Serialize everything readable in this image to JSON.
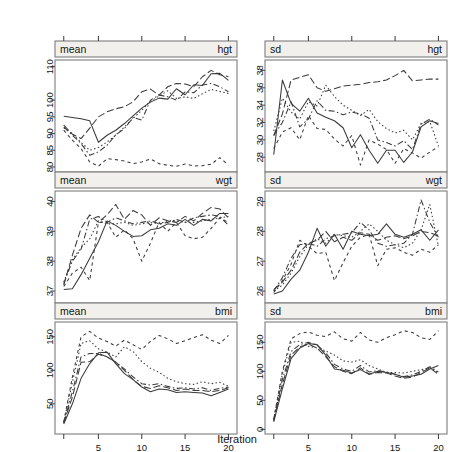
{
  "figure": {
    "xlabel": "Iteration",
    "x_ticks": [
      5,
      10,
      15,
      20
    ],
    "xlim": [
      1,
      20
    ],
    "n_chains": 5,
    "line_styles": [
      "solid",
      "dashed",
      "dotted",
      "dashdot",
      "longdash"
    ],
    "line_color": "#3a3a3a"
  },
  "panels": [
    {
      "id": "mean-hgt",
      "row": 0,
      "col": 0,
      "strip_left": "mean",
      "strip_right": "hgt",
      "y_ticks": [
        80,
        85,
        90,
        95,
        100,
        110
      ],
      "ylim": [
        78.5,
        112
      ]
    },
    {
      "id": "sd-hgt",
      "row": 0,
      "col": 1,
      "strip_left": "sd",
      "strip_right": "hgt",
      "y_ticks": [
        28,
        30,
        32,
        34,
        36,
        38
      ],
      "ylim": [
        26.3,
        39.2
      ]
    },
    {
      "id": "mean-wgt",
      "row": 1,
      "col": 0,
      "strip_left": "mean",
      "strip_right": "wgt",
      "y_ticks": [
        37,
        38,
        39,
        40
      ],
      "ylim": [
        36.6,
        40.35
      ]
    },
    {
      "id": "sd-wgt",
      "row": 1,
      "col": 1,
      "strip_left": "sd",
      "strip_right": "wgt",
      "y_ticks": [
        26,
        27,
        28,
        29
      ],
      "ylim": [
        25.6,
        29.35
      ]
    },
    {
      "id": "mean-bmi",
      "row": 2,
      "col": 0,
      "strip_left": "mean",
      "strip_right": "bmi",
      "y_ticks": [
        50,
        100,
        150
      ],
      "ylim": [
        5,
        172
      ]
    },
    {
      "id": "sd-bmi",
      "row": 2,
      "col": 1,
      "strip_left": "sd",
      "strip_right": "bmi",
      "y_ticks": [
        0,
        50,
        100,
        150
      ],
      "ylim": [
        -8,
        185
      ]
    }
  ],
  "chart_data": {
    "type": "line",
    "title": "",
    "xlabel": "Iteration",
    "ylabel": "",
    "x": [
      1,
      2,
      3,
      4,
      5,
      6,
      7,
      8,
      9,
      10,
      11,
      12,
      13,
      14,
      15,
      16,
      17,
      18,
      19,
      20
    ],
    "panels": [
      {
        "panel": "mean-hgt",
        "ylim": [
          78.5,
          112
        ],
        "yticks": [
          80,
          85,
          90,
          95,
          100,
          110
        ],
        "series": [
          {
            "name": "chain1",
            "style": "solid",
            "values": [
              95.2,
              94.8,
              94.4,
              93.8,
              87.4,
              89.5,
              91.0,
              93.0,
              95.3,
              97.6,
              99.4,
              100.6,
              100.3,
              103.4,
              101.6,
              104.6,
              104.4,
              107.9,
              108.0,
              105.9
            ]
          },
          {
            "name": "chain2",
            "style": "dashed",
            "values": [
              92.5,
              89.8,
              88.5,
              91.6,
              95.0,
              96.5,
              97.4,
              98.0,
              99.5,
              102.5,
              103.3,
              101.5,
              104.0,
              105.0,
              104.8,
              104.0,
              107.0,
              108.9,
              107.6,
              107.0
            ]
          },
          {
            "name": "chain3",
            "style": "dotted",
            "values": [
              91.7,
              90.0,
              87.3,
              85.0,
              85.8,
              87.5,
              89.5,
              92.0,
              94.5,
              97.0,
              99.7,
              101.2,
              102.8,
              100.5,
              101.0,
              100.5,
              101.9,
              103.2,
              102.6,
              102.0
            ]
          },
          {
            "name": "chain4",
            "style": "dashdot",
            "values": [
              92.0,
              89.5,
              87.0,
              83.5,
              84.5,
              86.5,
              89.6,
              91.5,
              94.8,
              94.0,
              100.0,
              101.5,
              101.0,
              100.0,
              102.5,
              102.2,
              104.5,
              105.0,
              104.0,
              102.5
            ]
          },
          {
            "name": "chain5",
            "style": "longdash",
            "values": [
              91.0,
              88.0,
              85.5,
              81.5,
              80.2,
              82.5,
              82.2,
              81.8,
              81.0,
              81.5,
              82.4,
              81.0,
              80.5,
              80.2,
              80.9,
              80.3,
              80.4,
              80.8,
              82.8,
              80.6
            ]
          }
        ]
      },
      {
        "panel": "sd-hgt",
        "ylim": [
          26.3,
          39.2
        ],
        "yticks": [
          28,
          30,
          32,
          34,
          36,
          38
        ],
        "series": [
          {
            "name": "chain1",
            "style": "solid",
            "values": [
              28.3,
              36.9,
              34.2,
              33.3,
              34.8,
              33.1,
              32.6,
              32.2,
              31.4,
              29.1,
              30.6,
              28.8,
              27.3,
              28.8,
              28.8,
              27.4,
              28.6,
              31.5,
              32.2,
              31.9
            ]
          },
          {
            "name": "chain2",
            "style": "dashed",
            "values": [
              30.5,
              33.0,
              36.9,
              37.2,
              37.5,
              36.0,
              35.6,
              35.9,
              36.2,
              36.3,
              36.4,
              36.6,
              36.7,
              36.9,
              37.4,
              38.0,
              36.8,
              36.9,
              37.0,
              37.0
            ]
          },
          {
            "name": "chain3",
            "style": "dotted",
            "values": [
              31.0,
              34.8,
              33.2,
              32.4,
              34.4,
              33.9,
              36.3,
              35.0,
              34.0,
              33.4,
              32.8,
              33.5,
              32.1,
              31.3,
              30.8,
              31.1,
              30.0,
              31.9,
              32.1,
              29.3
            ]
          },
          {
            "name": "chain4",
            "style": "dashdot",
            "values": [
              30.5,
              32.0,
              34.4,
              31.5,
              32.4,
              34.5,
              33.4,
              33.3,
              32.9,
              33.2,
              33.0,
              32.5,
              30.0,
              29.7,
              29.3,
              29.9,
              28.9,
              31.8,
              32.4,
              31.7
            ]
          },
          {
            "name": "chain5",
            "style": "longdash",
            "values": [
              29.0,
              30.9,
              31.4,
              30.0,
              32.8,
              31.3,
              31.2,
              30.1,
              29.3,
              30.5,
              27.1,
              30.0,
              29.5,
              28.9,
              27.3,
              29.0,
              28.5,
              27.9,
              28.6,
              29.2
            ]
          }
        ]
      },
      {
        "panel": "mean-wgt",
        "ylim": [
          36.6,
          40.35
        ],
        "yticks": [
          37,
          38,
          39,
          40
        ],
        "series": [
          {
            "name": "chain1",
            "style": "solid",
            "values": [
              37.05,
              37.08,
              37.55,
              38.1,
              38.65,
              39.35,
              39.2,
              39.0,
              38.83,
              38.85,
              39.05,
              39.1,
              39.25,
              39.2,
              39.4,
              39.2,
              39.4,
              39.35,
              39.6,
              39.6
            ]
          },
          {
            "name": "chain2",
            "style": "dashed",
            "values": [
              37.2,
              38.2,
              39.1,
              39.55,
              39.3,
              39.55,
              39.9,
              39.4,
              39.7,
              39.55,
              39.2,
              39.45,
              39.35,
              39.3,
              39.5,
              39.35,
              39.6,
              39.8,
              39.75,
              39.45
            ]
          },
          {
            "name": "chain3",
            "style": "dotted",
            "values": [
              37.3,
              38.05,
              38.45,
              38.75,
              39.35,
              39.25,
              39.25,
              39.3,
              39.2,
              39.25,
              39.3,
              39.25,
              39.35,
              39.35,
              39.3,
              39.3,
              39.35,
              39.4,
              39.45,
              39.5
            ]
          },
          {
            "name": "chain4",
            "style": "dashdot",
            "values": [
              37.25,
              38.0,
              38.4,
              39.4,
              39.5,
              39.3,
              39.45,
              39.35,
              39.25,
              39.3,
              39.35,
              39.25,
              39.3,
              39.4,
              39.3,
              39.45,
              39.5,
              39.55,
              39.5,
              39.2
            ]
          },
          {
            "name": "chain5",
            "style": "longdash",
            "values": [
              37.15,
              37.6,
              37.8,
              37.35,
              39.3,
              39.3,
              38.8,
              39.05,
              38.75,
              38.0,
              38.6,
              39.3,
              39.0,
              39.3,
              38.85,
              38.75,
              38.8,
              39.1,
              39.45,
              39.3
            ]
          }
        ]
      },
      {
        "panel": "sd-wgt",
        "ylim": [
          25.6,
          29.35
        ],
        "yticks": [
          26,
          27,
          28,
          29
        ],
        "series": [
          {
            "name": "chain1",
            "style": "solid",
            "values": [
              25.9,
              26.0,
              26.4,
              26.7,
              27.3,
              28.1,
              27.5,
              27.9,
              27.4,
              28.0,
              27.9,
              27.85,
              27.9,
              28.25,
              27.9,
              27.8,
              27.9,
              28.05,
              27.7,
              28.05
            ]
          },
          {
            "name": "chain2",
            "style": "dashed",
            "values": [
              26.05,
              26.3,
              26.7,
              27.3,
              27.6,
              27.7,
              28.0,
              27.65,
              27.8,
              27.7,
              27.95,
              27.9,
              27.7,
              27.8,
              27.85,
              27.75,
              27.85,
              28.0,
              27.95,
              27.85
            ]
          },
          {
            "name": "chain3",
            "style": "dotted",
            "values": [
              26.0,
              26.2,
              26.6,
              27.15,
              27.55,
              27.75,
              27.6,
              27.9,
              27.85,
              27.8,
              28.0,
              28.25,
              28.0,
              27.7,
              27.55,
              27.45,
              27.6,
              28.05,
              28.9,
              27.5
            ]
          },
          {
            "name": "chain4",
            "style": "dashdot",
            "values": [
              26.0,
              26.45,
              27.1,
              27.55,
              27.6,
              27.5,
              27.75,
              27.85,
              27.9,
              27.95,
              28.3,
              28.05,
              27.6,
              27.5,
              27.55,
              27.6,
              27.9,
              29.05,
              28.3,
              27.8
            ]
          },
          {
            "name": "chain5",
            "style": "longdash",
            "values": [
              25.95,
              26.35,
              26.9,
              27.7,
              27.5,
              27.25,
              27.3,
              26.35,
              26.95,
              27.5,
              27.8,
              27.9,
              26.85,
              27.4,
              27.45,
              27.3,
              27.2,
              27.4,
              27.3,
              27.55
            ]
          }
        ]
      },
      {
        "panel": "mean-bmi",
        "ylim": [
          5,
          172
        ],
        "yticks": [
          50,
          100,
          150
        ],
        "series": [
          {
            "name": "chain1",
            "style": "solid",
            "values": [
              20,
              50,
              88,
              110,
              126,
              127,
              110,
              95,
              86,
              75,
              68,
              72,
              71,
              67,
              68,
              67,
              66,
              62,
              67,
              72
            ]
          },
          {
            "name": "chain2",
            "style": "dashed",
            "values": [
              22,
              60,
              112,
              113,
              124,
              120,
              112,
              100,
              86,
              76,
              73,
              77,
              74,
              70,
              72,
              70,
              70,
              68,
              70,
              74
            ]
          },
          {
            "name": "chain3",
            "style": "dotted",
            "values": [
              22,
              82,
              140,
              144,
              132,
              127,
              120,
              135,
              128,
              113,
              103,
              97,
              88,
              83,
              80,
              79,
              83,
              80,
              82,
              76
            ]
          },
          {
            "name": "chain4",
            "style": "dashdot",
            "values": [
              22,
              68,
              120,
              125,
              125,
              120,
              112,
              102,
              90,
              80,
              78,
              80,
              76,
              73,
              74,
              72,
              74,
              70,
              73,
              75
            ]
          },
          {
            "name": "chain5",
            "style": "longdash",
            "values": [
              23,
              90,
              150,
              158,
              148,
              143,
              136,
              145,
              138,
              131,
              143,
              152,
              147,
              140,
              144,
              149,
              153,
              145,
              140,
              152
            ]
          }
        ]
      },
      {
        "panel": "sd-bmi",
        "ylim": [
          -8,
          185
        ],
        "yticks": [
          0,
          50,
          100,
          150
        ],
        "series": [
          {
            "name": "chain1",
            "style": "solid",
            "values": [
              13,
              70,
              122,
              140,
              148,
              146,
              128,
              104,
              102,
              97,
              103,
              95,
              100,
              98,
              95,
              90,
              92,
              95,
              104,
              110
            ]
          },
          {
            "name": "chain2",
            "style": "dashed",
            "values": [
              15,
              78,
              128,
              142,
              147,
              140,
              125,
              108,
              100,
              96,
              106,
              95,
              98,
              97,
              92,
              88,
              90,
              98,
              106,
              95
            ]
          },
          {
            "name": "chain3",
            "style": "dotted",
            "values": [
              17,
              96,
              150,
              152,
              143,
              140,
              135,
              128,
              118,
              116,
              120,
              110,
              104,
              98,
              98,
              97,
              100,
              103,
              106,
              98
            ]
          },
          {
            "name": "chain4",
            "style": "dashdot",
            "values": [
              16,
              86,
              134,
              146,
              150,
              145,
              132,
              112,
              104,
              100,
              110,
              99,
              101,
              99,
              95,
              91,
              94,
              100,
              108,
              99
            ]
          },
          {
            "name": "chain5",
            "style": "longdash",
            "values": [
              18,
              100,
              156,
              165,
              168,
              162,
              160,
              168,
              156,
              152,
              167,
              154,
              150,
              158,
              163,
              170,
              167,
              158,
              155,
              170
            ]
          }
        ]
      }
    ]
  }
}
